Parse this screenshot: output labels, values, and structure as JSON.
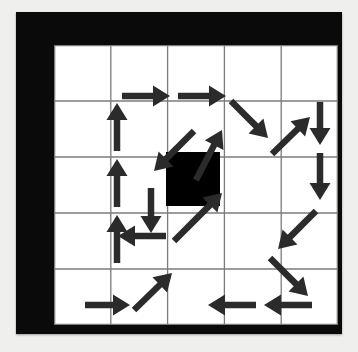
{
  "scene": {
    "title": "Arrow grid flow diagram",
    "background_color": "#efefed",
    "frame_color": "#0a0a0a",
    "board_color": "#ffffff",
    "grid_line_color": "#7b7b7b",
    "arrow_color": "#2b2b2b",
    "obstacle_color": "#000000"
  },
  "grid": {
    "columns": 5,
    "rows": 5,
    "cell_width": 56.8,
    "cell_height": 56.0,
    "line_width": 1.3,
    "col_lines": [
      0,
      56.8,
      113.6,
      170.4,
      227.2,
      284
    ],
    "row_lines": [
      0,
      56,
      112,
      168,
      224,
      280
    ]
  },
  "obstacle": {
    "label": "center-black-square",
    "col": 2,
    "row": 2,
    "x": 112,
    "y": 107,
    "width": 54,
    "height": 54
  },
  "arrow_style": {
    "shaft_width": 6.5,
    "head_length": 17,
    "head_half_width": 10.5
  },
  "arrows": [
    {
      "name": "arrow-up-left-col-r4",
      "dir": "up",
      "x1": 63,
      "y1": 218,
      "x2": 63,
      "y2": 170
    },
    {
      "name": "arrow-up-left-col-r3",
      "dir": "up",
      "x1": 63,
      "y1": 162,
      "x2": 63,
      "y2": 114
    },
    {
      "name": "arrow-up-left-col-r2",
      "dir": "up",
      "x1": 63,
      "y1": 106,
      "x2": 63,
      "y2": 58
    },
    {
      "name": "arrow-right-top-c1",
      "dir": "right",
      "x1": 68,
      "y1": 51,
      "x2": 116,
      "y2": 51
    },
    {
      "name": "arrow-right-top-c2",
      "dir": "right",
      "x1": 124,
      "y1": 51,
      "x2": 172,
      "y2": 51
    },
    {
      "name": "arrow-down-right-top",
      "dir": "down-right",
      "x1": 177,
      "y1": 56,
      "x2": 214,
      "y2": 93
    },
    {
      "name": "arrow-up-right-tr",
      "dir": "up-right",
      "x1": 218,
      "y1": 109,
      "x2": 256,
      "y2": 72
    },
    {
      "name": "arrow-down-right-c5-r1",
      "dir": "down",
      "x1": 266,
      "y1": 57,
      "x2": 266,
      "y2": 100
    },
    {
      "name": "arrow-down-right-c5-r2",
      "dir": "down",
      "x1": 266,
      "y1": 108,
      "x2": 266,
      "y2": 155
    },
    {
      "name": "arrow-down-left-right-mid",
      "dir": "down-left",
      "x1": 262,
      "y1": 166,
      "x2": 224,
      "y2": 204
    },
    {
      "name": "arrow-down-right-br",
      "dir": "down-right",
      "x1": 216,
      "y1": 213,
      "x2": 254,
      "y2": 251
    },
    {
      "name": "arrow-left-bottom-c5",
      "dir": "left",
      "x1": 258,
      "y1": 260,
      "x2": 210,
      "y2": 260
    },
    {
      "name": "arrow-left-bottom-c4",
      "dir": "left",
      "x1": 202,
      "y1": 260,
      "x2": 154,
      "y2": 260
    },
    {
      "name": "arrow-up-right-bottom",
      "dir": "up-right",
      "x1": 80,
      "y1": 265,
      "x2": 118,
      "y2": 228
    },
    {
      "name": "arrow-right-bottom-c1",
      "dir": "right",
      "x1": 31,
      "y1": 260,
      "x2": 76,
      "y2": 260
    },
    {
      "name": "arrow-up-right-inner-low",
      "dir": "up-right",
      "x1": 120,
      "y1": 196,
      "x2": 168,
      "y2": 148
    },
    {
      "name": "arrow-left-mid-low",
      "dir": "left",
      "x1": 112,
      "y1": 191,
      "x2": 64,
      "y2": 191
    },
    {
      "name": "arrow-down-inner-left",
      "dir": "down",
      "x1": 97,
      "y1": 143,
      "x2": 97,
      "y2": 188
    },
    {
      "name": "arrow-down-left-inner",
      "dir": "down-left",
      "x1": 140,
      "y1": 86,
      "x2": 100,
      "y2": 126
    },
    {
      "name": "arrow-up-inner-center",
      "dir": "up-right",
      "x1": 142,
      "y1": 135,
      "x2": 168,
      "y2": 85
    }
  ]
}
